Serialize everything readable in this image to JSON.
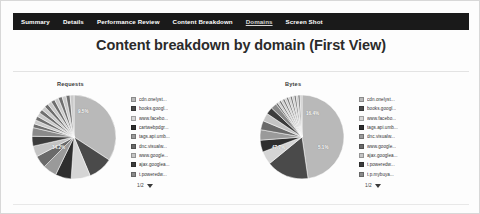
{
  "nav": {
    "items": [
      {
        "label": "Summary",
        "active": false
      },
      {
        "label": "Details",
        "active": false
      },
      {
        "label": "Performance Review",
        "active": false
      },
      {
        "label": "Content Breakdown",
        "active": false
      },
      {
        "label": "Domains",
        "active": true
      },
      {
        "label": "Screen Shot",
        "active": false
      }
    ]
  },
  "header": {
    "title": "Content breakdown by domain (First View)"
  },
  "pager": {
    "label": "1/2",
    "arrow_icon": "chevron-down-icon"
  },
  "chart_data": [
    {
      "type": "pie",
      "title": "Requests",
      "legend_position": "right",
      "categories": [
        "cdn.onelyst...",
        "books.googl...",
        "www.facebo...",
        "cartwebpdgr...",
        "tags.api.umb...",
        "dnc.visualw...",
        "www.google...",
        "ajax.googlea...",
        "t.poweredw..."
      ],
      "values": [
        34.2,
        9.5,
        7.4,
        6.1,
        5.3,
        4.8,
        4.2,
        3.8,
        3.3
      ],
      "other_value": 21.4,
      "data_labels": [
        {
          "text": "34.2%",
          "category": "cdn.onelyst..."
        },
        {
          "text": "9.5%",
          "category": "books.googl..."
        }
      ],
      "colors": [
        "#b9b9b9",
        "#4a4a4a",
        "#d5d5d5",
        "#2e2e2e",
        "#9a9a9a",
        "#6a6a6a",
        "#c4c4c4",
        "#3c3c3c",
        "#8a8a8a"
      ]
    },
    {
      "type": "pie",
      "title": "Bytes",
      "legend_position": "right",
      "categories": [
        "cdn.onelyst...",
        "books.googl...",
        "www.facebo...",
        "tags.api.umb...",
        "dnc.visualw...",
        "www.google...",
        "ajax.googlea...",
        "t.poweredw...",
        "t.p.mybuya..."
      ],
      "values": [
        47.7,
        16.4,
        5.1,
        4.6,
        4.0,
        3.5,
        3.1,
        2.7,
        2.3
      ],
      "other_value": 10.6,
      "data_labels": [
        {
          "text": "47.7%",
          "category": "cdn.onelyst..."
        },
        {
          "text": "16.4%",
          "category": "books.googl..."
        },
        {
          "text": "5.1%",
          "category": "www.facebo..."
        }
      ],
      "colors": [
        "#b9b9b9",
        "#4a4a4a",
        "#d5d5d5",
        "#2e2e2e",
        "#9a9a9a",
        "#6a6a6a",
        "#c4c4c4",
        "#3c3c3c",
        "#8a8a8a"
      ]
    }
  ],
  "theme": {
    "navbar_bg": "#1a1a1a",
    "navbar_text": "#ffffff",
    "page_bg": "#fdfdfd",
    "border": "#d8d8d8"
  }
}
